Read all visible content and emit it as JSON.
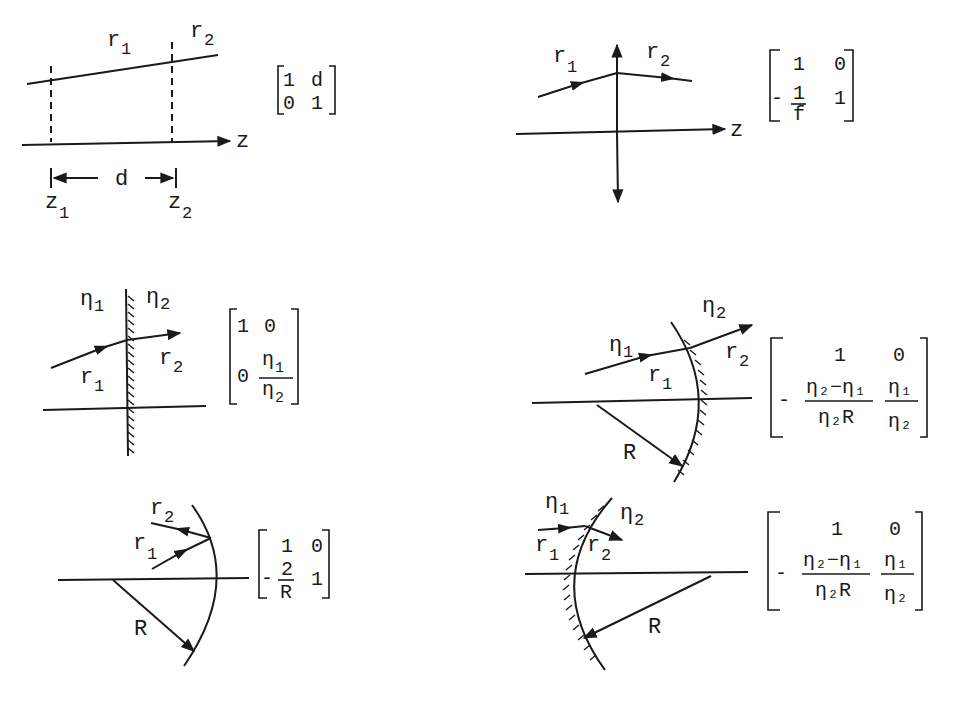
{
  "figure": {
    "panels": [
      {
        "id": "free-space",
        "labels": {
          "ray_in": "r",
          "ray_in_sub": "1",
          "ray_out": "r",
          "ray_out_sub": "2",
          "axis": "z",
          "distance": "d",
          "z1": "z",
          "z1_sub": "1",
          "z2": "z",
          "z2_sub": "2"
        },
        "matrix": {
          "a": "1",
          "b": "d",
          "c": "0",
          "d": "1"
        }
      },
      {
        "id": "thin-lens",
        "labels": {
          "ray_in": "r",
          "ray_in_sub": "1",
          "ray_out": "r",
          "ray_out_sub": "2",
          "axis": "z"
        },
        "matrix": {
          "a": "1",
          "b": "0",
          "c_sign": "-",
          "c_num": "1",
          "c_den": "f",
          "d": "1"
        }
      },
      {
        "id": "planar-interface",
        "labels": {
          "n1": "η",
          "n1_sub": "1",
          "n2": "η",
          "n2_sub": "2",
          "ray_in": "r",
          "ray_in_sub": "1",
          "ray_out": "r",
          "ray_out_sub": "2"
        },
        "matrix": {
          "a": "1",
          "b": "0",
          "c": "0",
          "d_num": "η",
          "d_num_sub": "1",
          "d_den": "η",
          "d_den_sub": "2"
        }
      },
      {
        "id": "curved-interface-convex",
        "labels": {
          "n1": "η",
          "n1_sub": "1",
          "n2": "η",
          "n2_sub": "2",
          "ray_in": "r",
          "ray_in_sub": "1",
          "ray_out": "r",
          "ray_out_sub": "2",
          "radius": "R"
        },
        "matrix": {
          "a": "1",
          "b": "0",
          "c_sign": "-",
          "c_num": "η₂−η₁",
          "c_den": "η₂R",
          "d_num": "η₁",
          "d_den": "η₂"
        }
      },
      {
        "id": "spherical-mirror",
        "labels": {
          "ray_in": "r",
          "ray_in_sub": "1",
          "ray_out": "r",
          "ray_out_sub": "2",
          "radius": "R"
        },
        "matrix": {
          "a": "1",
          "b": "0",
          "c_sign": "-",
          "c_num": "2",
          "c_den": "R",
          "d": "1"
        }
      },
      {
        "id": "curved-interface-concave",
        "labels": {
          "n1": "η",
          "n1_sub": "1",
          "n2": "η",
          "n2_sub": "2",
          "ray_in": "r",
          "ray_in_sub": "1",
          "ray_out": "r",
          "ray_out_sub": "2",
          "radius": "R"
        },
        "matrix": {
          "a": "1",
          "b": "0",
          "c_sign": "-",
          "c_num": "η₂−η₁",
          "c_den": "η₂R",
          "d_num": "η₁",
          "d_den": "η₂"
        }
      }
    ]
  }
}
